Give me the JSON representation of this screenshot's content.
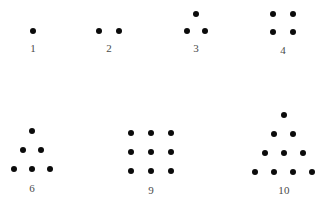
{
  "figure": {
    "background_color": "#ffffff",
    "dot_color": "#0b0b0b",
    "label_color": "#4a4a4a",
    "width": 327,
    "height": 210,
    "dot_diameter": 6
  },
  "chart_data": {
    "type": "scatter",
    "title": "",
    "subtitle": "",
    "xlabel": "",
    "ylabel": "",
    "grid": false,
    "legend": null,
    "xlim": [
      0,
      327
    ],
    "ylim": [
      210,
      0
    ],
    "groups": [
      {
        "label": "1",
        "count": 1,
        "shape": "point",
        "label_x": 33,
        "label_y": 48,
        "points": [
          {
            "x": 33,
            "y": 31
          }
        ]
      },
      {
        "label": "2",
        "count": 2,
        "shape": "line",
        "label_x": 109,
        "label_y": 48,
        "points": [
          {
            "x": 99,
            "y": 31
          },
          {
            "x": 119,
            "y": 31
          }
        ]
      },
      {
        "label": "3",
        "count": 3,
        "shape": "triangle",
        "label_x": 196,
        "label_y": 48,
        "points": [
          {
            "x": 196,
            "y": 14
          },
          {
            "x": 187,
            "y": 31
          },
          {
            "x": 205,
            "y": 31
          }
        ]
      },
      {
        "label": "4",
        "count": 4,
        "shape": "square",
        "label_x": 283,
        "label_y": 50,
        "points": [
          {
            "x": 273,
            "y": 14
          },
          {
            "x": 293,
            "y": 14
          },
          {
            "x": 273,
            "y": 32
          },
          {
            "x": 293,
            "y": 32
          }
        ]
      },
      {
        "label": "6",
        "count": 6,
        "shape": "triangle",
        "label_x": 32,
        "label_y": 188,
        "points": [
          {
            "x": 32,
            "y": 131
          },
          {
            "x": 23,
            "y": 150
          },
          {
            "x": 41,
            "y": 150
          },
          {
            "x": 14,
            "y": 169
          },
          {
            "x": 32,
            "y": 169
          },
          {
            "x": 50,
            "y": 169
          }
        ]
      },
      {
        "label": "9",
        "count": 9,
        "shape": "square",
        "label_x": 151,
        "label_y": 190,
        "points": [
          {
            "x": 131,
            "y": 133
          },
          {
            "x": 151,
            "y": 133
          },
          {
            "x": 171,
            "y": 133
          },
          {
            "x": 131,
            "y": 152
          },
          {
            "x": 151,
            "y": 152
          },
          {
            "x": 171,
            "y": 152
          },
          {
            "x": 131,
            "y": 171
          },
          {
            "x": 151,
            "y": 171
          },
          {
            "x": 171,
            "y": 171
          }
        ]
      },
      {
        "label": "10",
        "count": 10,
        "shape": "triangle",
        "label_x": 284,
        "label_y": 190,
        "points": [
          {
            "x": 284,
            "y": 115
          },
          {
            "x": 274,
            "y": 134
          },
          {
            "x": 293,
            "y": 134
          },
          {
            "x": 265,
            "y": 153
          },
          {
            "x": 284,
            "y": 153
          },
          {
            "x": 303,
            "y": 153
          },
          {
            "x": 255,
            "y": 172
          },
          {
            "x": 274,
            "y": 172
          },
          {
            "x": 293,
            "y": 172
          },
          {
            "x": 312,
            "y": 172
          }
        ]
      }
    ]
  }
}
